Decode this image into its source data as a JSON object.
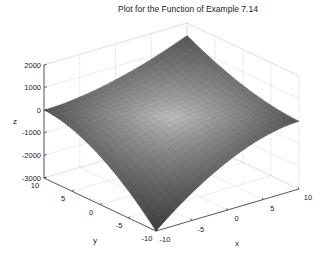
{
  "chart_data": {
    "type": "surface3d",
    "title": "Plot for the Function of Example 7.14",
    "xlabel": "x",
    "ylabel": "y",
    "zlabel": "z",
    "xlim": [
      -10,
      10
    ],
    "ylim": [
      -10,
      10
    ],
    "zlim": [
      -3000,
      2000
    ],
    "xticks": [
      -10,
      -5,
      0,
      5,
      10
    ],
    "yticks": [
      -10,
      -5,
      0,
      5,
      10
    ],
    "zticks": [
      -3000,
      -2000,
      -1000,
      0,
      1000,
      2000
    ],
    "xtick_labels": [
      "-10",
      "-5",
      "0",
      "5",
      "10"
    ],
    "ytick_labels": [
      "-10",
      "-5",
      "0",
      "5",
      "10"
    ],
    "ztick_labels": [
      "-3000",
      "-2000",
      "-1000",
      "0",
      "1000",
      "2000"
    ],
    "grid": true,
    "grid_style": "dotted",
    "box": true,
    "colormap": "gray",
    "surface_corners": [
      {
        "x": 10,
        "y": 10,
        "z": 2000,
        "note": "back peak"
      },
      {
        "x": -10,
        "y": 10,
        "z": 0
      },
      {
        "x": 10,
        "y": -10,
        "z": 0
      },
      {
        "x": -10,
        "y": -10,
        "z": -3000,
        "note": "front trough"
      }
    ],
    "surface_description": "Saddle-like surface, center near z=0, rising to ~2000 at (10,10) and falling to ~-3000 at (-10,-10); dense mesh with moiré pattern near center",
    "view": {
      "azimuth": -37.5,
      "elevation": 30
    }
  },
  "colors": {
    "background": "#ffffff",
    "axis": "#333333",
    "grid": "#bbbbbb",
    "surface_dark": "#3a3a3a",
    "surface_mid": "#7a7a7a",
    "surface_light": "#b5b5b5"
  }
}
